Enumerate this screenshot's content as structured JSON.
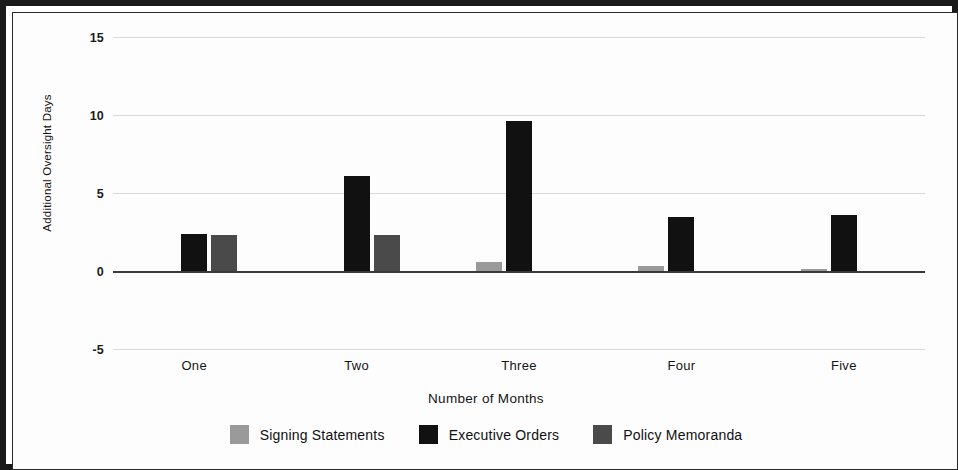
{
  "chart_data": {
    "type": "bar",
    "title": "",
    "xlabel": "Number of Months",
    "ylabel": "Additional Oversight Days",
    "categories": [
      "One",
      "Two",
      "Three",
      "Four",
      "Five"
    ],
    "ylim": [
      -5,
      15
    ],
    "yticks": [
      15,
      10,
      5,
      0,
      -5
    ],
    "ytick_labels": [
      "15",
      "10",
      "5",
      "0",
      "-5"
    ],
    "grid": true,
    "legend_position": "bottom",
    "series": [
      {
        "name": "Signing Statements",
        "color": "#9a9a9a",
        "values": [
          0,
          0,
          0.6,
          0.3,
          0.15
        ]
      },
      {
        "name": "Executive Orders",
        "color": "#111111",
        "values": [
          2.4,
          6.1,
          9.6,
          3.45,
          3.6
        ]
      },
      {
        "name": "Policy Memoranda",
        "color": "#4a4a4a",
        "values": [
          2.3,
          2.3,
          0,
          0,
          0
        ]
      }
    ]
  }
}
